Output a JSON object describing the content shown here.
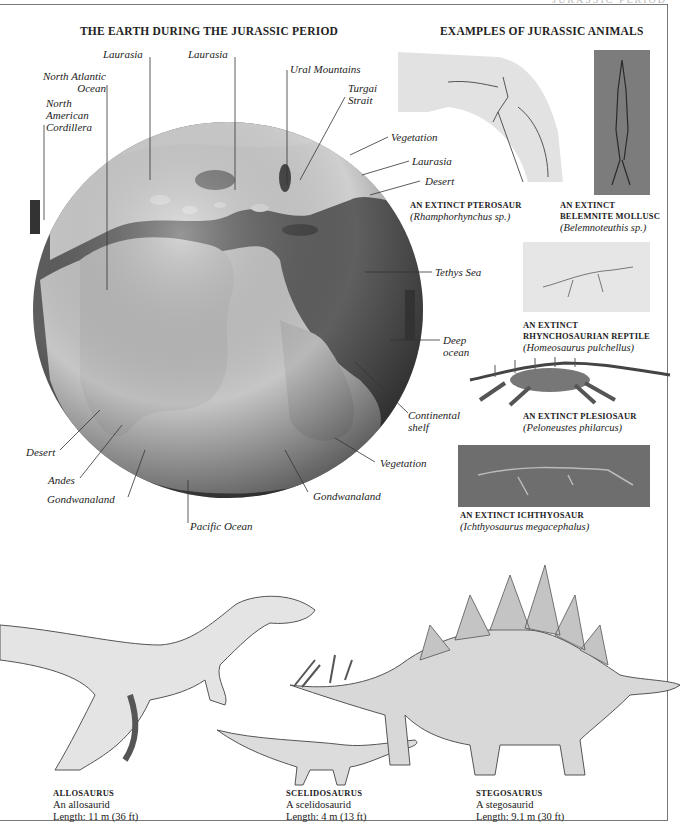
{
  "running_head": "JURASSIC PERIOD",
  "left_section": {
    "title": "THE EARTH DURING THE JURASSIC PERIOD",
    "labels": {
      "laurasia_1": "Laurasia",
      "laurasia_2": "Laurasia",
      "north_atlantic": [
        "North Atlantic",
        "Ocean"
      ],
      "north_american_cordillera": [
        "North",
        "American",
        "Cordillera"
      ],
      "ural_mountains": "Ural Mountains",
      "turgai_strait": [
        "Turgai",
        "Strait"
      ],
      "vegetation_1": "Vegetation",
      "laurasia_3": "Laurasia",
      "desert_1": "Desert",
      "tethys_sea": "Tethys Sea",
      "deep_ocean": [
        "Deep",
        "ocean"
      ],
      "continental_shelf": [
        "Continental",
        "shelf"
      ],
      "vegetation_2": "Vegetation",
      "gondwanaland_1": "Gondwanaland",
      "desert_2": "Desert",
      "andes": "Andes",
      "gondwanaland_2": "Gondwanaland",
      "pacific_ocean": "Pacific Ocean"
    }
  },
  "right_section": {
    "title": "EXAMPLES OF JURASSIC ANIMALS",
    "fossils": [
      {
        "name": "AN EXTINCT PTEROSAUR",
        "species": "(Rhamphorhynchus sp.)"
      },
      {
        "name_lines": [
          "AN EXTINCT",
          "BELEMNITE MOLLUSC"
        ],
        "species": "(Belemnoteuthis sp.)"
      },
      {
        "name_lines": [
          "AN EXTINCT",
          "RHYNCHOSAURIAN REPTILE"
        ],
        "species": "(Homeosaurus pulchellus)"
      },
      {
        "name": "AN EXTINCT PLESIOSAUR",
        "species": "(Peloneustes philarcus)"
      },
      {
        "name": "AN EXTINCT ICHTHYOSAUR",
        "species": "(Ichthyosaurus megacephalus)"
      }
    ]
  },
  "dinosaurs": [
    {
      "name": "ALLOSAURUS",
      "group": "An allosaurid",
      "length": "Length: 11 m (36 ft)"
    },
    {
      "name": "SCELIDOSAURUS",
      "group": "A scelidosaurid",
      "length": "Length: 4 m (13 ft)"
    },
    {
      "name": "STEGOSAURUS",
      "group": "A stegosaurid",
      "length": "Length: 9.1 m (30 ft)"
    }
  ],
  "colors": {
    "ocean": "#5f5f5f",
    "land": "#c9c9c9",
    "globe_edge": "#3a3a3a",
    "text": "#222222",
    "frame": "#777777"
  }
}
